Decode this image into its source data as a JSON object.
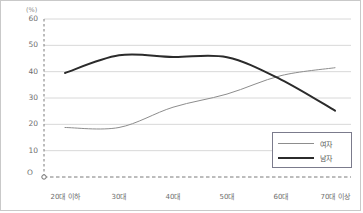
{
  "chart_data": {
    "type": "line",
    "title": "",
    "subtitle": "",
    "xlabel": "",
    "ylabel": "",
    "unit_label": "(%)",
    "origin_label": "O",
    "categories": [
      "20대 이하",
      "30대",
      "40대",
      "50대",
      "60대",
      "70대 이상"
    ],
    "yticks": [
      60,
      50,
      40,
      30,
      20,
      10
    ],
    "ylim": [
      0,
      60
    ],
    "grid": true,
    "legend_position": "bottom-right",
    "series": [
      {
        "name": "여자",
        "values": [
          18.8,
          18.8,
          26.5,
          31.5,
          38.5,
          41.5
        ],
        "color": "#8d8d8d",
        "width": 1
      },
      {
        "name": "남자",
        "values": [
          39.5,
          46.2,
          45.6,
          45.5,
          37.0,
          25.2
        ],
        "color": "#2b2b2b",
        "width": 2
      }
    ]
  },
  "axes": {
    "unit": "(%)",
    "origin": "O",
    "y_tick_labels": [
      "60",
      "50",
      "40",
      "30",
      "20",
      "10"
    ],
    "x_tick_labels": [
      "20대 이하",
      "30대",
      "40대",
      "50대",
      "60대",
      "70대 이상"
    ]
  },
  "legend": {
    "items": [
      {
        "label": "여자"
      },
      {
        "label": "남자"
      }
    ]
  },
  "colors": {
    "frame": "#c9c9c9",
    "grid": "#d8d8d8",
    "axis": "#7a7a7a",
    "female_line": "#8d8d8d",
    "male_line": "#2b2b2b",
    "tick_text": "#6e6e6e",
    "legend_border": "#7b7b8c"
  }
}
